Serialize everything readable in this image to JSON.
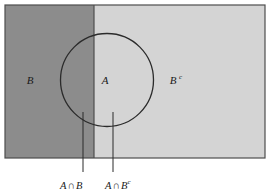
{
  "diagram": {
    "type": "venn-set-diagram",
    "title": "",
    "universe": {
      "name": "sample-space-rectangle",
      "x": 5,
      "y": 5,
      "width": 260,
      "height": 153,
      "border_color": "#4d4d4d"
    },
    "regions": [
      {
        "id": "B",
        "label": "B",
        "description": "Left half of rectangle, dark gray shading, set B",
        "fill": "#8c8c8c",
        "label_x": 30,
        "label_y": 80
      },
      {
        "id": "Bc",
        "label": "B",
        "superscript": "c",
        "description": "Right portion of rectangle, light gray shading, complement of B",
        "fill": "#d4d4d4",
        "label_x": 175,
        "label_y": 80
      }
    ],
    "circle": {
      "id": "A",
      "label": "A",
      "cx": 107,
      "cy": 80,
      "r": 47,
      "stroke": "#2b2b2b",
      "label_x": 104,
      "label_y": 82
    },
    "divider": {
      "name": "b-boundary-line",
      "x": 94,
      "y1": 5,
      "y2": 158,
      "color": "#4d4d4d"
    },
    "annotations": [
      {
        "id": "A-inter-B",
        "text_main": "A",
        "operator": "∩",
        "text_second": "B",
        "superscript": "",
        "leader_x": 83,
        "leader_y1": 112,
        "leader_y2": 172,
        "label_x": 62,
        "label_y": 186
      },
      {
        "id": "A-inter-Bc",
        "text_main": "A",
        "operator": "∩",
        "text_second": "B",
        "superscript": "c",
        "leader_x": 113,
        "leader_y1": 112,
        "leader_y2": 172,
        "label_x": 106,
        "label_y": 186
      }
    ],
    "colors": {
      "dark_gray": "#8c8c8c",
      "light_gray": "#d4d4d4",
      "outline": "#4d4d4d",
      "circle_stroke": "#2b2b2b",
      "text": "#1a1a1a",
      "background": "#ffffff"
    }
  }
}
